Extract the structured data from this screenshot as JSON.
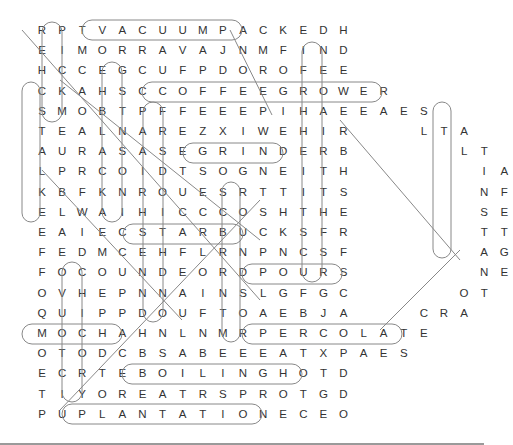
{
  "puzzle": {
    "title": "Coffee Word Search",
    "grid": [
      "RPTVACUUMPACKEDH",
      "EIMORRAVAJNMFIND",
      "HCCEGCUFPDOROFEE",
      "CKAHSCCOFFEEGROWER",
      "SMOBTPFFEEEPIHAEEAES",
      "TEALNAREZXIWEHIR",
      "AURASASEGRINDERB",
      "LPRCOIDTSOGNEITH",
      "KBFKNROUESRTTITS",
      "ELWAIHICCCOSHTHE",
      "EAIECSTARBUCKSFR",
      "FEDMCEHFLRNPNCSF",
      "FOCOUNDEORDPOURS",
      "OVHEPNNAINSLGFGC",
      "QUIPPDOUFTOAEBJA",
      "MOCHAHNLNMRPERCOLATE",
      "OTODCBSABEEEATXPAES",
      "ECRTEBOILINGHOTD",
      "TIYOREATRSPROTGD",
      "PUPLANTATIONECEO"
    ],
    "handle_letters": [
      {
        "row": 5,
        "col": 19,
        "text": "L"
      },
      {
        "row": 5,
        "col": 20,
        "text": "T"
      },
      {
        "row": 5,
        "col": 21,
        "text": "A"
      },
      {
        "row": 6,
        "col": 21,
        "text": "L"
      },
      {
        "row": 6,
        "col": 22,
        "text": "T"
      },
      {
        "row": 7,
        "col": 22,
        "text": "I"
      },
      {
        "row": 7,
        "col": 23,
        "text": "A"
      },
      {
        "row": 8,
        "col": 22,
        "text": "N"
      },
      {
        "row": 8,
        "col": 23,
        "text": "F"
      },
      {
        "row": 9,
        "col": 22,
        "text": "S"
      },
      {
        "row": 9,
        "col": 23,
        "text": "E"
      },
      {
        "row": 10,
        "col": 22,
        "text": "T"
      },
      {
        "row": 10,
        "col": 23,
        "text": "T"
      },
      {
        "row": 11,
        "col": 22,
        "text": "A"
      },
      {
        "row": 11,
        "col": 23,
        "text": "G"
      },
      {
        "row": 12,
        "col": 22,
        "text": "N"
      },
      {
        "row": 12,
        "col": 23,
        "text": "E"
      },
      {
        "row": 13,
        "col": 21,
        "text": "O"
      },
      {
        "row": 13,
        "col": 22,
        "text": "T"
      },
      {
        "row": 14,
        "col": 19,
        "text": "C"
      },
      {
        "row": 14,
        "col": 20,
        "text": "R"
      },
      {
        "row": 14,
        "col": 21,
        "text": "A"
      }
    ],
    "found_words": [
      "VACUUMPACKED",
      "FIND",
      "COFFEEGROWER",
      "GRINDER",
      "STARBUCKS",
      "POURS",
      "PERCOLATE",
      "BOILINGHOT",
      "PLANTATION",
      "MOCHA",
      "INSTANT",
      "DRIP",
      "JAVA"
    ]
  }
}
